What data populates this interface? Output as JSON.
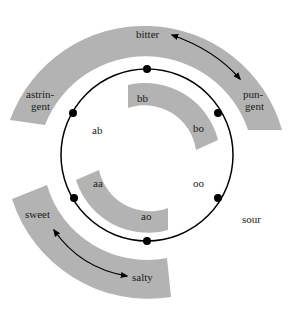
{
  "colors": {
    "band": "#b3b3b3",
    "line": "#000000",
    "text": "#1a1a1a",
    "background": "#ffffff"
  },
  "outer_band": {
    "labels": {
      "bitter": "bitter",
      "astringent_1": "astrin-",
      "astringent_2": "gent",
      "pungent_1": "pun-",
      "pungent_2": "gent"
    }
  },
  "lower_band": {
    "labels": {
      "sweet": "sweet",
      "salty": "salty"
    }
  },
  "outside_label": {
    "sour": "sour"
  },
  "inner_bands": {
    "upper": {
      "labels": [
        "bb",
        "bo"
      ]
    },
    "lower": {
      "labels": [
        "aa",
        "ao"
      ]
    }
  },
  "circle_labels": {
    "ab": "ab",
    "oo": "oo"
  },
  "circle": {
    "dot_count": 6
  }
}
